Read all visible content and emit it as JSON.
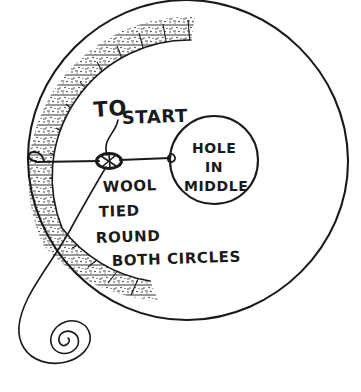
{
  "figure": {
    "title": "Wool tied round both circles",
    "background_color": "#ffffff",
    "ink_color": "#1a1a1a",
    "style": "hand-drawn pen sketch"
  },
  "labels": {
    "to": "TO",
    "start": "START",
    "hole_line1": "HOLE",
    "hole_line2": "IN",
    "hole_line3": "MIDDLE",
    "wool": "WOOL",
    "tied": "TIED",
    "round": "ROUND",
    "both_circles": "BOTH CIRCLES"
  },
  "shapes": {
    "outer_circle": {
      "name": "outer-circle",
      "cx": 188,
      "cy": 160,
      "r": 160
    },
    "hole_circle": {
      "name": "hole-in-middle-circle",
      "cx": 214,
      "cy": 160,
      "r": 44
    },
    "hatched_band": {
      "name": "hatched-crescent-band",
      "description": "stippled radial hatched crescent along upper-left arc",
      "outer_r": 160,
      "inner_r": 137,
      "start_angle_deg": 168,
      "end_angle_deg": 290
    },
    "knot": {
      "name": "wool-knot",
      "cx": 109,
      "cy": 161,
      "rx": 12,
      "ry": 7
    },
    "coil": {
      "name": "wool-coil-spiral",
      "cx": 62,
      "cy": 350,
      "turns": 3
    }
  }
}
